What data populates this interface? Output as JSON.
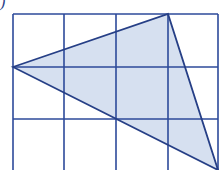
{
  "label": ")",
  "colors": {
    "grid": "#2c4a9a",
    "triangle_stroke": "#263f86",
    "triangle_fill": "#d6e0f0",
    "background": "#ffffff"
  },
  "grid": {
    "columns": 4,
    "rows_visible": 3,
    "x_lines": [
      13,
      64,
      116,
      168,
      218
    ],
    "y_lines": [
      14,
      67,
      119,
      171
    ],
    "top": 14,
    "bottom": 172,
    "left": 13,
    "right": 218
  },
  "triangle": {
    "vertices": [
      [
        13,
        67
      ],
      [
        168,
        14
      ],
      [
        218,
        170
      ]
    ],
    "shaded": true
  }
}
